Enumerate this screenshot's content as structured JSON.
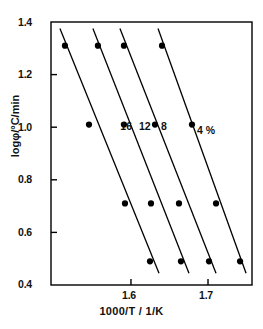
{
  "chart_data": {
    "type": "scatter",
    "title": "",
    "xlabel": "1000/T / 1/K",
    "ylabel": "logφ/°C/min",
    "xlim": [
      1.4962,
      1.7571
    ],
    "ylim": [
      0.4,
      1.4
    ],
    "xticks": [
      1.6,
      1.7
    ],
    "xtick_labels": [
      "1.6",
      "1.7"
    ],
    "yticks": [
      0.4,
      0.6,
      0.8,
      1.0,
      1.2,
      1.4
    ],
    "ytick_labels": [
      "0.4",
      "0.6",
      "0.8",
      "1.0",
      "1.2",
      "1.4"
    ],
    "grid": false,
    "legend": "inline-annotations",
    "marker": "filled-circle",
    "marker_color": "#000000",
    "line_color": "#000000",
    "series": [
      {
        "name": "16",
        "label": "16",
        "label_x": 1.5862,
        "label_y": 1.0,
        "x": [
          1.5143,
          1.5455,
          1.5922,
          1.6247
        ],
        "y": [
          1.31,
          1.01,
          0.71,
          0.49
        ],
        "fit_x": [
          1.5078,
          1.6364
        ],
        "fit_y": [
          1.375,
          0.445
        ]
      },
      {
        "name": "12",
        "label": "12",
        "label_x": 1.6104,
        "label_y": 1.0,
        "x": [
          1.5571,
          1.5909,
          1.626,
          1.6649
        ],
        "y": [
          1.31,
          1.01,
          0.71,
          0.49
        ],
        "fit_x": [
          1.5506,
          1.6753
        ],
        "fit_y": [
          1.375,
          0.445
        ]
      },
      {
        "name": "8",
        "label": "8",
        "label_x": 1.639,
        "label_y": 1.0,
        "x": [
          1.5909,
          1.6312,
          1.6623,
          1.7013
        ],
        "y": [
          1.31,
          1.01,
          0.71,
          0.49
        ],
        "fit_x": [
          1.5857,
          1.7104
        ],
        "fit_y": [
          1.375,
          0.445
        ]
      },
      {
        "name": "4 %",
        "label": "4 %",
        "label_x": 1.6857,
        "label_y": 0.985,
        "x": [
          1.6403,
          1.6792,
          1.7104,
          1.7416
        ],
        "y": [
          1.31,
          1.01,
          0.71,
          0.49
        ],
        "fit_x": [
          1.6351,
          1.7494
        ],
        "fit_y": [
          1.375,
          0.445
        ]
      }
    ]
  }
}
